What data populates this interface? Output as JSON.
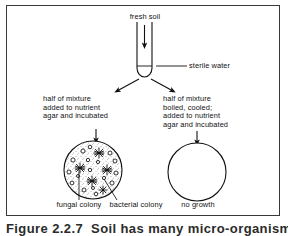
{
  "figure": {
    "caption": "Figure 2.2.7  Soil has many micro-organisms",
    "border_color": "#3a3a3a",
    "ink_color": "#111111"
  },
  "labels": {
    "fresh_soil": "fresh soil",
    "sterile_water": "sterile water",
    "left_branch": "half of mixture\nadded to nutrient\nagar and incubated",
    "right_branch": "half of mixture\nboiled, cooled;\nadded to nutrient\nagar and incubated",
    "fungal_colony": "fungal colony",
    "bacterial_colony": "bacterial colony",
    "no_growth": "no growth"
  },
  "apparatus": {
    "test_tube": {
      "name": "test-tube",
      "left_wall_x": 137,
      "right_wall_x": 152,
      "top_y": 22,
      "bottom_y": 77,
      "water_line_y": 66
    },
    "pour_arrow": {
      "name": "soil-pour-arrow",
      "x": 144,
      "from_y": 25,
      "to_y": 45
    },
    "split_arrows": [
      {
        "name": "split-arrow-left",
        "x1": 138,
        "y1": 79,
        "x2": 116,
        "y2": 91
      },
      {
        "name": "split-arrow-right",
        "x1": 152,
        "y1": 79,
        "x2": 174,
        "y2": 91
      }
    ],
    "down_arrows": [
      {
        "name": "incubate-arrow-left",
        "x": 96,
        "y1": 129,
        "y2": 141
      },
      {
        "name": "incubate-arrow-right",
        "x": 197,
        "y1": 131,
        "y2": 143
      }
    ]
  },
  "plates": {
    "left_plate": {
      "name": "agar-plate-with-growth",
      "cx": 93,
      "cy": 170,
      "r": 29,
      "fungal_colonies": [
        {
          "x": 99,
          "y": 153,
          "r": 5
        },
        {
          "x": 80,
          "y": 168,
          "r": 5
        },
        {
          "x": 107,
          "y": 170,
          "r": 5
        },
        {
          "x": 92,
          "y": 181,
          "r": 5
        },
        {
          "x": 103,
          "y": 190,
          "r": 4
        }
      ],
      "bacterial_colonies": [
        {
          "x": 83,
          "y": 151,
          "r": 2.1
        },
        {
          "x": 90,
          "y": 147,
          "r": 1.8
        },
        {
          "x": 110,
          "y": 153,
          "r": 2.0
        },
        {
          "x": 73,
          "y": 160,
          "r": 2.1
        },
        {
          "x": 88,
          "y": 160,
          "r": 1.7
        },
        {
          "x": 98,
          "y": 162,
          "r": 1.6
        },
        {
          "x": 115,
          "y": 161,
          "r": 2.0
        },
        {
          "x": 69,
          "y": 172,
          "r": 2.0
        },
        {
          "x": 90,
          "y": 170,
          "r": 1.7
        },
        {
          "x": 116,
          "y": 173,
          "r": 2.0
        },
        {
          "x": 72,
          "y": 183,
          "r": 1.9
        },
        {
          "x": 84,
          "y": 190,
          "r": 2.0
        },
        {
          "x": 96,
          "y": 194,
          "r": 1.8
        },
        {
          "x": 112,
          "y": 183,
          "r": 2.1
        },
        {
          "x": 78,
          "y": 176,
          "r": 1.5
        },
        {
          "x": 104,
          "y": 178,
          "r": 1.6
        },
        {
          "x": 93,
          "y": 188,
          "r": 1.5
        }
      ]
    },
    "right_plate": {
      "name": "agar-plate-no-growth",
      "cx": 197,
      "cy": 172,
      "r": 29
    }
  },
  "leader_lines": {
    "sterile_water": {
      "x1": 156,
      "y1": 66,
      "x2": 186,
      "y2": 66
    },
    "fungal_colony": {
      "x1": 79,
      "y1": 169,
      "x2": 79,
      "y2": 199
    },
    "bacterial_colony": {
      "x1": 104,
      "y1": 180,
      "x2": 116,
      "y2": 199
    }
  }
}
